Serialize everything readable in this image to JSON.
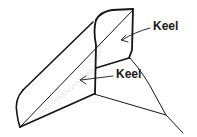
{
  "diagram": {
    "labels": [
      {
        "text": "Keel",
        "x": 153,
        "y": 30
      },
      {
        "text": "Keel",
        "x": 116,
        "y": 78
      }
    ],
    "colors": {
      "ink": "#151515",
      "background": "#ffffff"
    }
  }
}
